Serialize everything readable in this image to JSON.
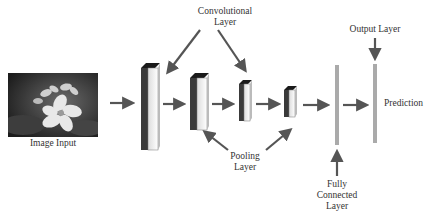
{
  "diagram": {
    "input": {
      "label": "Image Input",
      "image_alt": "flower-photo"
    },
    "labels": {
      "convolutional": [
        "Convolutional",
        "Layer"
      ],
      "pooling": [
        "Pooling",
        "Layer"
      ],
      "fully_connected": [
        "Fully",
        "Connected",
        "Layer"
      ],
      "output": "Output Layer",
      "prediction": "Prediction"
    },
    "blocks": [
      {
        "name": "conv-block-1",
        "x": 141,
        "y": 63,
        "w": 19,
        "h": 87
      },
      {
        "name": "pool-block-1",
        "x": 190,
        "y": 73,
        "w": 19,
        "h": 57
      },
      {
        "name": "conv-block-2",
        "x": 239,
        "y": 80,
        "w": 13,
        "h": 41
      },
      {
        "name": "pool-block-2",
        "x": 284,
        "y": 86,
        "w": 13,
        "h": 31
      }
    ],
    "bars": [
      {
        "name": "fully-connected-bar",
        "x": 335,
        "y": 65,
        "w": 4,
        "h": 80
      },
      {
        "name": "output-bar",
        "x": 373,
        "y": 64,
        "w": 4,
        "h": 79
      }
    ],
    "colors": {
      "arrow": "#555555",
      "bar": "#aaaaaa",
      "block_dark": "#2b2b2b",
      "block_face": "#f4f4f4"
    }
  }
}
